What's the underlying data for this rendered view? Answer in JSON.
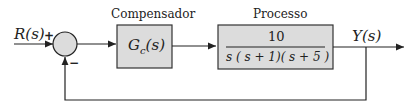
{
  "diagram": {
    "type": "closed-loop block diagram",
    "input": {
      "label": "R(s)"
    },
    "output": {
      "label": "Y(s)"
    },
    "summing_junction": {
      "plus_sign": "+",
      "minus_sign": "−"
    },
    "compensator": {
      "title": "Compensador",
      "transfer_function": "Gc(s)",
      "symbol": "G",
      "subscript": "c",
      "arg": "(s)"
    },
    "process": {
      "title": "Processo",
      "numerator": "10",
      "denominator": "s ( s + 1)( s + 5 )"
    },
    "colors": {
      "block_fill": "#dcdcdc",
      "line": "#222222",
      "junction_fill": "#dcdcdc"
    }
  }
}
